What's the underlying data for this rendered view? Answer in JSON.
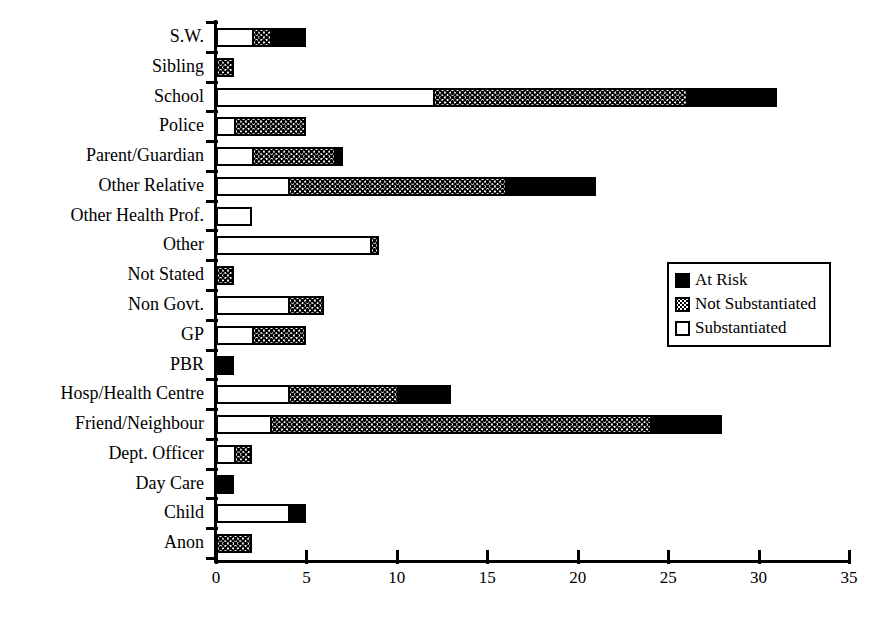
{
  "chart_data": {
    "type": "bar",
    "orientation": "horizontal",
    "stacked": true,
    "title": "",
    "xlabel": "",
    "ylabel": "",
    "xlim": [
      0,
      35
    ],
    "xticks": [
      0,
      5,
      10,
      15,
      20,
      25,
      30,
      35
    ],
    "xtick_labels": [
      "0",
      "5",
      "10",
      "15",
      "20",
      "25",
      "30",
      "35"
    ],
    "grid": false,
    "legend_position": "center-right",
    "categories": [
      "S.W.",
      "Sibling",
      "School",
      "Police",
      "Parent/Guardian",
      "Other Relative",
      "Other Health Prof.",
      "Other",
      "Not Stated",
      "Non Govt.",
      "GP",
      "PBR",
      "Hosp/Health Centre",
      "Friend/Neighbour",
      "Dept. Officer",
      "Day Care",
      "Child",
      "Anon"
    ],
    "series": [
      {
        "name": "Substantiated",
        "fill": "white",
        "color": "#ffffff",
        "values": [
          2,
          0,
          12,
          1,
          2,
          4,
          2,
          8.5,
          0,
          4,
          2,
          0,
          4,
          3,
          1,
          0,
          4,
          0
        ]
      },
      {
        "name": "Not Substantiated",
        "fill": "stipple",
        "color": "#808080",
        "values": [
          1,
          1,
          14,
          4,
          4.5,
          12,
          0,
          0.5,
          1,
          2,
          3,
          0,
          6,
          21,
          1,
          0,
          0,
          2
        ]
      },
      {
        "name": "At Risk",
        "fill": "solid-black",
        "color": "#000000",
        "values": [
          2,
          0,
          5,
          0,
          0.5,
          5,
          0,
          0,
          0,
          0,
          0,
          1,
          3,
          4,
          0,
          1,
          1,
          0
        ]
      }
    ],
    "totals": [
      5,
      1,
      31,
      5,
      7,
      21,
      2,
      9,
      1,
      6,
      5,
      1,
      13,
      28,
      2,
      1,
      5,
      2
    ]
  },
  "legend": {
    "items": [
      {
        "label": "At Risk",
        "swatch": "solid-black-swatch"
      },
      {
        "label": "Not Substantiated",
        "swatch": "stipple-swatch"
      },
      {
        "label": "Substantiated",
        "swatch": "white-swatch"
      }
    ]
  }
}
